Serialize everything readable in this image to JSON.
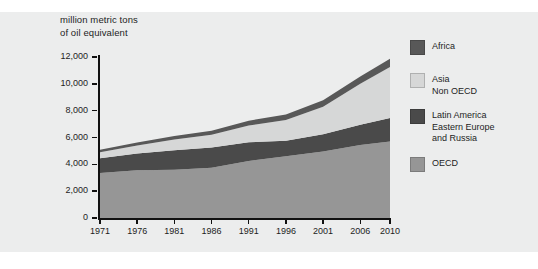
{
  "figure": {
    "background_color": "#ffffff",
    "panel_color": "#eceded",
    "axis_color": "#111111",
    "axis_title": "million metric tons\nof oil equivalent"
  },
  "chart_data": {
    "type": "area",
    "stacked": true,
    "title": "",
    "subtitle": "",
    "xlabel": "",
    "ylabel": "million metric tons of oil equivalent",
    "x": [
      1971,
      1976,
      1981,
      1986,
      1991,
      1996,
      2001,
      2006,
      2010
    ],
    "tick_labels_x": [
      "1971",
      "1976",
      "1981",
      "1986",
      "1991",
      "1996",
      "2001",
      "2006",
      "2010"
    ],
    "tick_labels_y": [
      "0",
      "2,000",
      "4,000",
      "6,000",
      "8,000",
      "10,000",
      "12,000"
    ],
    "ylim": [
      0,
      12000
    ],
    "xlim": [
      1971,
      2010
    ],
    "ytick_values": [
      0,
      2000,
      4000,
      6000,
      8000,
      10000,
      12000
    ],
    "grid": false,
    "legend_position": "right",
    "series": [
      {
        "name": "OECD",
        "color": "#969696",
        "values": [
          3350,
          3550,
          3600,
          3750,
          4250,
          4600,
          4950,
          5450,
          5700
        ]
      },
      {
        "name": "Latin America\nEastern Europe\nand Russia",
        "color": "#4a4a4a",
        "values": [
          1100,
          1250,
          1450,
          1500,
          1400,
          1150,
          1300,
          1500,
          1750
        ]
      },
      {
        "name": "Asia\nNon OECD",
        "color": "#d6d7d7",
        "values": [
          450,
          600,
          800,
          950,
          1250,
          1550,
          2050,
          3050,
          3800
        ]
      },
      {
        "name": "Africa",
        "color": "#585858",
        "values": [
          180,
          220,
          260,
          300,
          350,
          420,
          480,
          550,
          620
        ]
      }
    ],
    "totals": [
      5080,
      5620,
      6110,
      6500,
      7250,
      7720,
      8780,
      10550,
      11870
    ]
  },
  "legend": {
    "items": [
      {
        "label": "Africa",
        "color": "#585858"
      },
      {
        "label": "Asia\nNon OECD",
        "color": "#d6d7d7"
      },
      {
        "label": "Latin America\nEastern Europe\nand Russia",
        "color": "#4a4a4a"
      },
      {
        "label": "OECD",
        "color": "#969696"
      }
    ]
  }
}
